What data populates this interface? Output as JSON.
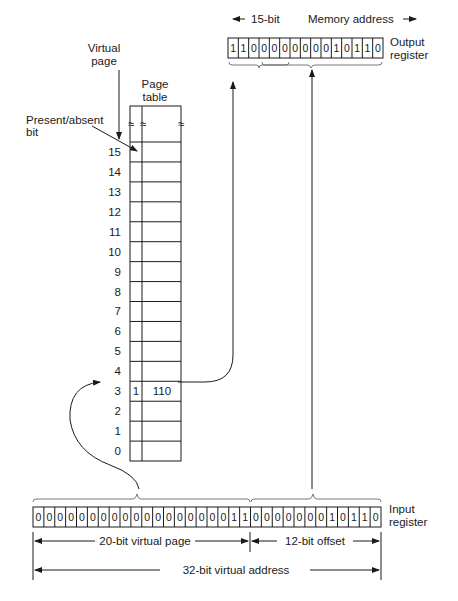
{
  "labels": {
    "virtual_page_line1": "Virtual",
    "virtual_page_line2": "page",
    "page_table_line1": "Page",
    "page_table_line2": "table",
    "present_absent_line1": "Present/absent",
    "present_absent_line2": "bit",
    "output_register_line1": "Output",
    "output_register_line2": "register",
    "input_register_line1": "Input",
    "input_register_line2": "register",
    "bits_15": "15-bit",
    "memory_address": "Memory address",
    "virtual_page_20bit": "20-bit virtual page",
    "offset_12bit": "12-bit offset",
    "virtual_address_32bit": "32-bit virtual address",
    "break_symbol": "≈"
  },
  "page_table": {
    "rows": [
      {
        "index": "15",
        "present": "",
        "frame": ""
      },
      {
        "index": "14",
        "present": "",
        "frame": ""
      },
      {
        "index": "13",
        "present": "",
        "frame": ""
      },
      {
        "index": "12",
        "present": "",
        "frame": ""
      },
      {
        "index": "11",
        "present": "",
        "frame": ""
      },
      {
        "index": "10",
        "present": "",
        "frame": ""
      },
      {
        "index": "9",
        "present": "",
        "frame": ""
      },
      {
        "index": "8",
        "present": "",
        "frame": ""
      },
      {
        "index": "7",
        "present": "",
        "frame": ""
      },
      {
        "index": "6",
        "present": "",
        "frame": ""
      },
      {
        "index": "5",
        "present": "",
        "frame": ""
      },
      {
        "index": "4",
        "present": "",
        "frame": ""
      },
      {
        "index": "3",
        "present": "1",
        "frame": "110"
      },
      {
        "index": "2",
        "present": "",
        "frame": ""
      },
      {
        "index": "1",
        "present": "",
        "frame": ""
      },
      {
        "index": "0",
        "present": "",
        "frame": ""
      }
    ]
  },
  "output_register": {
    "bits": [
      "1",
      "1",
      "0",
      "0",
      "0",
      "0",
      "0",
      "0",
      "0",
      "0",
      "1",
      "0",
      "1",
      "1",
      "0"
    ]
  },
  "input_register": {
    "bits": [
      "0",
      "0",
      "0",
      "0",
      "0",
      "0",
      "0",
      "0",
      "0",
      "0",
      "0",
      "0",
      "0",
      "0",
      "0",
      "0",
      "0",
      "0",
      "1",
      "1",
      "0",
      "0",
      "0",
      "0",
      "0",
      "0",
      "0",
      "1",
      "0",
      "1",
      "1",
      "0"
    ]
  }
}
